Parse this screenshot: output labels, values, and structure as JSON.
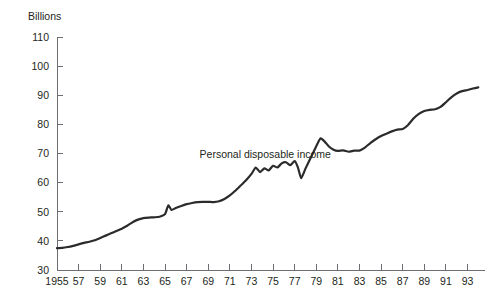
{
  "chart_data": {
    "type": "line",
    "title": "",
    "subtitle": "",
    "xlabel": "",
    "ylabel": "Billions",
    "ylabel_position": "top-left",
    "xlim": [
      1955,
      1994.25
    ],
    "ylim": [
      30,
      110
    ],
    "grid": false,
    "legend": false,
    "legend_position": "none",
    "line_color": "#2b2b2b",
    "axis_color": "#6d6e71",
    "text_color": "#231f20",
    "background_color": "#ffffff",
    "y_ticks": [
      30,
      40,
      50,
      60,
      70,
      80,
      90,
      100,
      110
    ],
    "y_tick_labels": [
      "30",
      "40",
      "50",
      "60",
      "70",
      "80",
      "90",
      "100",
      "110"
    ],
    "x_ticks": [
      1955,
      1957,
      1959,
      1961,
      1963,
      1965,
      1967,
      1969,
      1971,
      1973,
      1975,
      1977,
      1979,
      1981,
      1983,
      1985,
      1987,
      1989,
      1991,
      1993
    ],
    "x_tick_labels": [
      "1955",
      "57",
      "59",
      "61",
      "63",
      "65",
      "67",
      "69",
      "71",
      "73",
      "75",
      "77",
      "79",
      "81",
      "83",
      "85",
      "87",
      "89",
      "91",
      "93"
    ],
    "annotations": [
      {
        "text": "Personal disposable income",
        "x": 1968.2,
        "y": 68.5
      }
    ],
    "series": [
      {
        "name": "Personal disposable income",
        "units": "Billions",
        "x": [
          1955.0,
          1955.5,
          1956.0,
          1956.5,
          1957.0,
          1957.5,
          1958.0,
          1958.5,
          1959.0,
          1959.5,
          1960.0,
          1960.5,
          1961.0,
          1961.5,
          1962.0,
          1962.5,
          1963.0,
          1963.5,
          1964.0,
          1964.5,
          1965.0,
          1965.3,
          1965.6,
          1966.0,
          1966.5,
          1967.0,
          1967.5,
          1968.0,
          1968.5,
          1969.0,
          1969.5,
          1970.0,
          1970.5,
          1971.0,
          1971.5,
          1972.0,
          1972.5,
          1973.0,
          1973.4,
          1973.8,
          1974.2,
          1974.6,
          1975.0,
          1975.4,
          1975.8,
          1976.2,
          1976.6,
          1977.0,
          1977.3,
          1977.6,
          1978.0,
          1978.5,
          1979.0,
          1979.4,
          1979.8,
          1980.2,
          1980.6,
          1981.0,
          1981.5,
          1982.0,
          1982.5,
          1983.0,
          1983.5,
          1984.0,
          1984.5,
          1985.0,
          1985.5,
          1986.0,
          1986.5,
          1987.0,
          1987.5,
          1988.0,
          1988.5,
          1989.0,
          1989.5,
          1990.0,
          1990.5,
          1991.0,
          1991.5,
          1992.0,
          1992.5,
          1993.0,
          1993.5,
          1994.0
        ],
        "y": [
          37.5,
          37.6,
          37.9,
          38.3,
          38.8,
          39.3,
          39.7,
          40.2,
          41.0,
          41.8,
          42.6,
          43.4,
          44.2,
          45.2,
          46.4,
          47.3,
          47.8,
          48.0,
          48.1,
          48.3,
          49.2,
          52.2,
          50.6,
          51.3,
          52.0,
          52.6,
          53.0,
          53.3,
          53.4,
          53.4,
          53.3,
          53.6,
          54.4,
          55.6,
          57.2,
          59.0,
          60.8,
          63.0,
          65.2,
          63.6,
          64.9,
          64.2,
          65.8,
          65.2,
          66.6,
          67.0,
          66.0,
          67.4,
          65.2,
          61.5,
          64.8,
          68.6,
          72.5,
          75.2,
          74.0,
          72.3,
          71.3,
          70.9,
          71.1,
          70.6,
          71.0,
          71.0,
          72.0,
          73.6,
          74.9,
          76.0,
          76.8,
          77.6,
          78.2,
          78.4,
          79.8,
          82.0,
          83.6,
          84.6,
          85.0,
          85.2,
          86.0,
          87.6,
          89.3,
          90.6,
          91.4,
          91.8,
          92.3,
          92.7
        ]
      }
    ]
  }
}
